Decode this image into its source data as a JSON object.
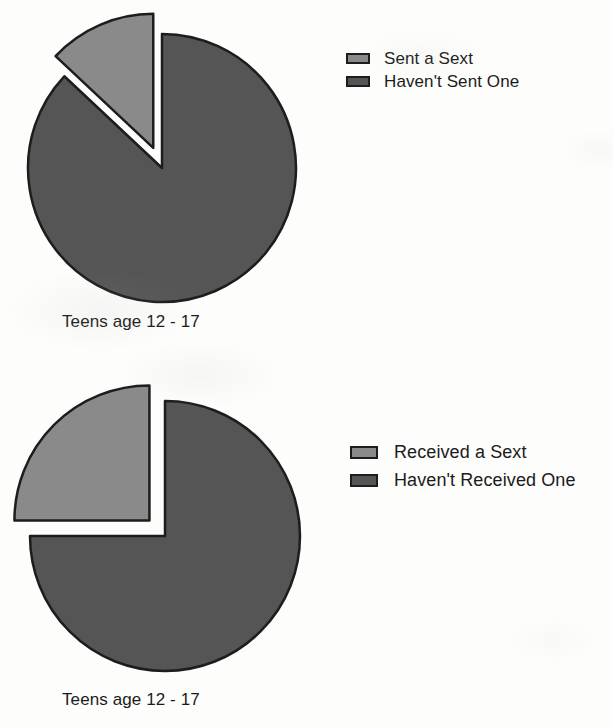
{
  "page": {
    "background_color": "#fdfdfc",
    "width": 613,
    "height": 727
  },
  "palette": {
    "light_slice": "#8a8a8a",
    "dark_slice": "#555555",
    "outline": "#1d1d1d",
    "text": "#1b1b1b",
    "background": "#ffffff"
  },
  "charts": {
    "sent": {
      "caption": "Teens age 12 - 17",
      "legend": [
        {
          "label": "Sent a Sext",
          "color": "#8a8a8a",
          "swatch": "legend-swatch-light"
        },
        {
          "label": "Haven't Sent One",
          "color": "#555555",
          "swatch": "legend-swatch-dark"
        }
      ]
    },
    "received": {
      "caption": "Teens age 12 - 17",
      "legend": [
        {
          "label": "Received a Sext",
          "color": "#8a8a8a",
          "swatch": "legend-swatch-light"
        },
        {
          "label": "Haven't Received One",
          "color": "#555555",
          "swatch": "legend-swatch-dark"
        }
      ]
    }
  },
  "chart_data": [
    {
      "type": "pie",
      "title": "",
      "subtitle": "Teens age 12 - 17",
      "xlabel": "",
      "ylabel": "",
      "categories": [
        "Sent a Sext",
        "Haven't Sent One"
      ],
      "values": [
        13,
        87
      ],
      "units": "percent",
      "colors": [
        "#8a8a8a",
        "#555555"
      ],
      "exploded_slices": [
        "Sent a Sext"
      ],
      "start_angle_deg": 0,
      "direction": "counterclockwise",
      "legend_position": "right",
      "grid": false,
      "annotations": []
    },
    {
      "type": "pie",
      "title": "",
      "subtitle": "Teens age 12 - 17",
      "xlabel": "",
      "ylabel": "",
      "categories": [
        "Received a Sext",
        "Haven't Received One"
      ],
      "values": [
        25,
        75
      ],
      "units": "percent",
      "colors": [
        "#8a8a8a",
        "#555555"
      ],
      "exploded_slices": [
        "Received a Sext"
      ],
      "start_angle_deg": 0,
      "direction": "counterclockwise",
      "legend_position": "right",
      "grid": false,
      "annotations": []
    }
  ]
}
